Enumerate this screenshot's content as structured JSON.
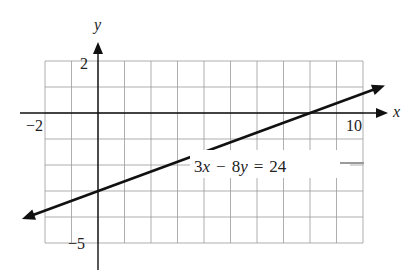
{
  "chart_data": {
    "type": "line",
    "title": "",
    "equation": "3x − 8y = 24",
    "xlabel": "x",
    "ylabel": "y",
    "xlim": [
      -2,
      10
    ],
    "ylim": [
      -5,
      2
    ],
    "grid": true,
    "x_tick_labels": [
      "−2",
      "10"
    ],
    "y_tick_labels": [
      "2",
      "−5"
    ],
    "series": [
      {
        "name": "3x − 8y = 24",
        "slope": 0.375,
        "intercept": -3,
        "x": [
          -2.87,
          0,
          8,
          10.83
        ],
        "y": [
          -4.08,
          -3,
          0,
          1.06
        ],
        "arrows": "both"
      }
    ],
    "annotations": [
      {
        "text": "3x − 8y = 24",
        "x": 6.5,
        "y": -2.2
      }
    ]
  },
  "labels": {
    "x_axis": "x",
    "y_axis": "y",
    "x_min": "−2",
    "x_max": "10",
    "y_max": "2",
    "y_min": "−5",
    "equation_coef_x": "3",
    "equation_var_x": "x",
    "equation_minus": "−",
    "equation_coef_y": "8",
    "equation_var_y": "y",
    "equation_eq": "=",
    "equation_rhs": "24"
  }
}
